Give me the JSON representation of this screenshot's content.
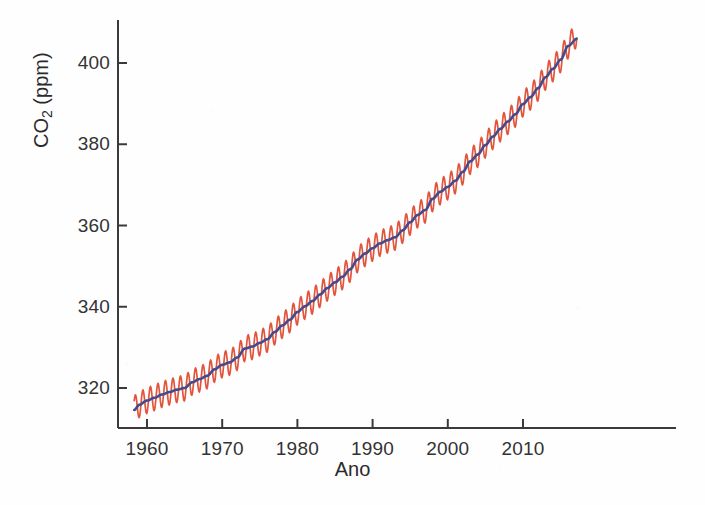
{
  "chart_data": {
    "type": "line",
    "title": "",
    "xlabel": "Ano",
    "ylabel": "CO2 (ppm)",
    "ylabel_base": "CO",
    "ylabel_sub": "2",
    "ylabel_unit": " (ppm)",
    "xlim": [
      1958,
      2017.5
    ],
    "ylim": [
      311,
      410
    ],
    "grid": false,
    "legend": "none",
    "xticks": [
      1960,
      1970,
      1980,
      1990,
      2000,
      2010
    ],
    "xtick_labels": [
      "1960",
      "1970",
      "1980",
      "1990",
      "2000",
      "2010"
    ],
    "yticks": [
      320,
      340,
      360,
      380,
      400
    ],
    "ytick_labels": [
      "320",
      "340",
      "360",
      "380",
      "400"
    ],
    "colors": {
      "monthly": "#e2553c",
      "trend": "#434b8e",
      "axis": "#3a3a3a",
      "background": "#fefefe"
    },
    "series": [
      {
        "name": "monthly",
        "description": "Monthly mean atmospheric CO2 at Mauna Loa with seasonal cycle",
        "color": "#e2553c",
        "seasonal_amplitude_ppm": 3.2,
        "x": [
          1958.3,
          1959,
          1960,
          1961,
          1962,
          1963,
          1964,
          1965,
          1966,
          1967,
          1968,
          1969,
          1970,
          1971,
          1972,
          1973,
          1974,
          1975,
          1976,
          1977,
          1978,
          1979,
          1980,
          1981,
          1982,
          1983,
          1984,
          1985,
          1986,
          1987,
          1988,
          1989,
          1990,
          1991,
          1992,
          1993,
          1994,
          1995,
          1996,
          1997,
          1998,
          1999,
          2000,
          2001,
          2002,
          2003,
          2004,
          2005,
          2006,
          2007,
          2008,
          2009,
          2010,
          2011,
          2012,
          2013,
          2014,
          2015,
          2016,
          2017.2
        ],
        "values": [
          315.0,
          315.9,
          316.9,
          317.6,
          318.4,
          319.0,
          319.6,
          320.0,
          321.4,
          322.2,
          323.0,
          324.6,
          325.7,
          326.3,
          327.5,
          329.7,
          330.2,
          331.1,
          332.0,
          333.8,
          335.4,
          336.8,
          338.7,
          340.1,
          341.4,
          343.0,
          344.6,
          346.0,
          347.4,
          349.2,
          351.6,
          353.1,
          354.4,
          355.6,
          356.4,
          357.1,
          358.8,
          360.8,
          362.6,
          363.8,
          366.6,
          368.3,
          369.5,
          371.0,
          373.2,
          375.8,
          377.5,
          379.8,
          381.9,
          383.8,
          385.6,
          387.4,
          389.9,
          391.6,
          393.8,
          396.5,
          398.6,
          400.8,
          404.2,
          407.0
        ]
      },
      {
        "name": "trend",
        "description": "Seasonally adjusted smoothed trend",
        "color": "#434b8e",
        "x": [
          1958.3,
          1959,
          1960,
          1961,
          1962,
          1963,
          1964,
          1965,
          1966,
          1967,
          1968,
          1969,
          1970,
          1971,
          1972,
          1973,
          1974,
          1975,
          1976,
          1977,
          1978,
          1979,
          1980,
          1981,
          1982,
          1983,
          1984,
          1985,
          1986,
          1987,
          1988,
          1989,
          1990,
          1991,
          1992,
          1993,
          1994,
          1995,
          1996,
          1997,
          1998,
          1999,
          2000,
          2001,
          2002,
          2003,
          2004,
          2005,
          2006,
          2007,
          2008,
          2009,
          2010,
          2011,
          2012,
          2013,
          2014,
          2015,
          2016,
          2017.2
        ],
        "values": [
          314.6,
          315.9,
          316.9,
          317.6,
          318.4,
          319.0,
          319.6,
          320.0,
          321.4,
          322.2,
          323.0,
          324.6,
          325.7,
          326.3,
          327.5,
          329.7,
          330.2,
          331.1,
          332.0,
          333.8,
          335.4,
          336.8,
          338.7,
          340.1,
          341.4,
          343.0,
          344.6,
          346.0,
          347.4,
          349.2,
          351.6,
          353.1,
          354.4,
          355.6,
          356.4,
          357.1,
          358.8,
          360.8,
          362.6,
          363.8,
          366.6,
          368.3,
          369.5,
          371.0,
          373.2,
          375.8,
          377.5,
          379.8,
          381.9,
          383.8,
          385.6,
          387.4,
          389.9,
          391.6,
          393.8,
          396.5,
          398.6,
          400.8,
          404.2,
          406.0
        ]
      }
    ]
  }
}
